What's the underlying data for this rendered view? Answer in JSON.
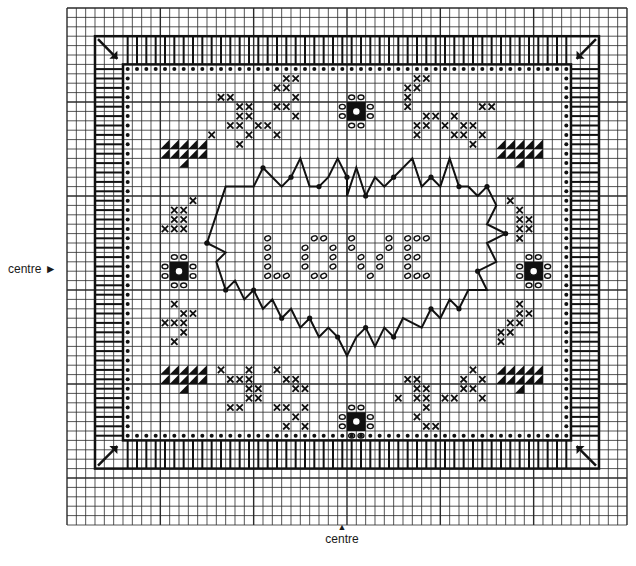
{
  "labels": {
    "centre_left": "centre ►",
    "centre_bottom_arrow": "▲",
    "centre_bottom": "centre"
  },
  "grid": {
    "left": 67,
    "top": 8,
    "cols": 60,
    "rows": 55,
    "cell_w": 9.333,
    "cell_h": 9.4,
    "line_color": "#2a2a2a",
    "bold_every": 10
  },
  "pattern": {
    "title": "LOVE heart sampler cross-stitch chart",
    "centre_text": "LOVE",
    "colors": {
      "ink": "#111111",
      "paper": "#ffffff"
    },
    "border": {
      "outer": [
        3,
        3,
        57,
        49
      ],
      "inner": [
        6,
        6,
        54,
        46
      ]
    },
    "dot_frame": [
      6,
      6,
      54,
      46
    ],
    "heart_outline": [
      [
        15,
        25
      ],
      [
        17,
        19
      ],
      [
        20,
        19
      ],
      [
        21,
        17
      ],
      [
        22,
        18
      ],
      [
        23,
        19
      ],
      [
        24,
        18
      ],
      [
        25,
        16
      ],
      [
        26,
        19
      ],
      [
        27,
        19
      ],
      [
        28,
        18
      ],
      [
        29,
        16
      ],
      [
        30,
        18
      ],
      [
        30,
        20
      ],
      [
        31,
        17
      ],
      [
        32,
        20
      ],
      [
        33,
        18
      ],
      [
        34,
        19
      ],
      [
        35,
        18
      ],
      [
        37,
        16
      ],
      [
        38,
        19
      ],
      [
        39,
        18
      ],
      [
        40,
        19
      ],
      [
        41,
        16
      ],
      [
        42,
        19
      ],
      [
        43,
        19
      ],
      [
        44,
        20
      ],
      [
        45,
        19
      ],
      [
        46,
        21
      ],
      [
        45,
        23
      ],
      [
        47,
        24
      ],
      [
        45,
        25
      ],
      [
        46,
        27
      ],
      [
        44,
        28
      ],
      [
        45,
        30
      ],
      [
        43,
        30
      ],
      [
        42,
        32
      ],
      [
        41,
        31
      ],
      [
        40,
        33
      ],
      [
        39,
        32
      ],
      [
        38,
        34
      ],
      [
        36,
        33
      ],
      [
        35,
        35
      ],
      [
        34,
        34
      ],
      [
        33,
        36
      ],
      [
        32,
        34
      ],
      [
        31,
        35
      ],
      [
        30,
        37
      ],
      [
        29,
        35
      ],
      [
        28,
        34
      ],
      [
        27,
        35
      ],
      [
        26,
        33
      ],
      [
        25,
        34
      ],
      [
        24,
        32
      ],
      [
        23,
        33
      ],
      [
        22,
        31
      ],
      [
        21,
        32
      ],
      [
        20,
        30
      ],
      [
        19,
        31
      ],
      [
        18,
        29
      ],
      [
        17,
        30
      ],
      [
        16,
        27
      ],
      [
        17,
        26
      ],
      [
        15,
        25
      ]
    ],
    "love_letters": [
      {
        "letter": "L",
        "cells": [
          [
            21,
            24
          ],
          [
            21,
            25
          ],
          [
            21,
            26
          ],
          [
            21,
            27
          ],
          [
            21,
            28
          ],
          [
            22,
            28
          ],
          [
            23,
            28
          ]
        ]
      },
      {
        "letter": "O",
        "cells": [
          [
            26,
            24
          ],
          [
            27,
            24
          ],
          [
            25,
            25
          ],
          [
            28,
            25
          ],
          [
            25,
            26
          ],
          [
            28,
            26
          ],
          [
            25,
            27
          ],
          [
            28,
            27
          ],
          [
            26,
            28
          ],
          [
            27,
            28
          ]
        ]
      },
      {
        "letter": "V",
        "cells": [
          [
            30,
            24
          ],
          [
            30,
            25
          ],
          [
            31,
            26
          ],
          [
            33,
            26
          ],
          [
            31,
            27
          ],
          [
            33,
            27
          ],
          [
            32,
            28
          ],
          [
            34,
            24
          ],
          [
            34,
            25
          ]
        ]
      },
      {
        "letter": "E",
        "cells": [
          [
            36,
            24
          ],
          [
            37,
            24
          ],
          [
            38,
            24
          ],
          [
            36,
            25
          ],
          [
            36,
            26
          ],
          [
            37,
            26
          ],
          [
            36,
            27
          ],
          [
            36,
            28
          ],
          [
            37,
            28
          ],
          [
            38,
            28
          ]
        ]
      }
    ],
    "motifs": {
      "triangles": [
        [
          10,
          14
        ],
        [
          46,
          14
        ],
        [
          10,
          38
        ],
        [
          46,
          38
        ]
      ],
      "rosettes": [
        [
          11,
          27
        ],
        [
          30,
          10
        ],
        [
          49,
          27
        ],
        [
          30,
          43
        ]
      ],
      "cross_clusters": [
        [
          [
            16,
            9
          ],
          [
            17,
            9
          ],
          [
            18,
            10
          ],
          [
            19,
            10
          ],
          [
            18,
            11
          ],
          [
            19,
            11
          ],
          [
            17,
            12
          ],
          [
            18,
            12
          ],
          [
            19,
            13
          ],
          [
            20,
            12
          ],
          [
            22,
            10
          ],
          [
            23,
            10
          ],
          [
            24,
            9
          ],
          [
            22,
            8
          ],
          [
            23,
            8
          ],
          [
            23,
            7
          ],
          [
            24,
            7
          ],
          [
            24,
            11
          ],
          [
            15,
            13
          ],
          [
            18,
            14
          ],
          [
            21,
            12
          ],
          [
            22,
            13
          ]
        ],
        [
          [
            36,
            8
          ],
          [
            37,
            8
          ],
          [
            36,
            9
          ],
          [
            36,
            10
          ],
          [
            37,
            7
          ],
          [
            38,
            7
          ],
          [
            38,
            11
          ],
          [
            39,
            11
          ],
          [
            37,
            12
          ],
          [
            38,
            12
          ],
          [
            37,
            13
          ],
          [
            41,
            11
          ],
          [
            42,
            12
          ],
          [
            42,
            13
          ],
          [
            43,
            12
          ],
          [
            44,
            13
          ],
          [
            43,
            14
          ],
          [
            44,
            10
          ],
          [
            45,
            10
          ],
          [
            40,
            12
          ],
          [
            41,
            13
          ]
        ],
        [
          [
            16,
            38
          ],
          [
            17,
            39
          ],
          [
            18,
            39
          ],
          [
            19,
            38
          ],
          [
            19,
            39
          ],
          [
            19,
            40
          ],
          [
            20,
            40
          ],
          [
            19,
            41
          ],
          [
            20,
            41
          ],
          [
            17,
            42
          ],
          [
            18,
            42
          ],
          [
            23,
            39
          ],
          [
            24,
            39
          ],
          [
            24,
            40
          ],
          [
            25,
            40
          ],
          [
            22,
            42
          ],
          [
            23,
            42
          ],
          [
            25,
            42
          ],
          [
            24,
            43
          ],
          [
            25,
            44
          ],
          [
            23,
            44
          ],
          [
            22,
            38
          ]
        ],
        [
          [
            36,
            39
          ],
          [
            37,
            39
          ],
          [
            37,
            40
          ],
          [
            38,
            40
          ],
          [
            37,
            41
          ],
          [
            38,
            41
          ],
          [
            38,
            42
          ],
          [
            37,
            43
          ],
          [
            38,
            44
          ],
          [
            39,
            44
          ],
          [
            40,
            41
          ],
          [
            41,
            41
          ],
          [
            42,
            40
          ],
          [
            43,
            40
          ],
          [
            42,
            39
          ],
          [
            43,
            38
          ],
          [
            44,
            39
          ],
          [
            44,
            41
          ],
          [
            35,
            41
          ]
        ],
        [
          [
            11,
            21
          ],
          [
            12,
            21
          ],
          [
            12,
            22
          ],
          [
            11,
            22
          ],
          [
            12,
            23
          ],
          [
            13,
            20
          ],
          [
            11,
            23
          ],
          [
            10,
            23
          ]
        ],
        [
          [
            11,
            31
          ],
          [
            12,
            32
          ],
          [
            11,
            33
          ],
          [
            12,
            33
          ],
          [
            10,
            33
          ],
          [
            12,
            34
          ],
          [
            11,
            35
          ],
          [
            13,
            32
          ]
        ],
        [
          [
            47,
            20
          ],
          [
            48,
            21
          ],
          [
            48,
            22
          ],
          [
            49,
            22
          ],
          [
            48,
            23
          ],
          [
            49,
            23
          ],
          [
            48,
            24
          ]
        ],
        [
          [
            48,
            31
          ],
          [
            48,
            32
          ],
          [
            47,
            33
          ],
          [
            48,
            33
          ],
          [
            49,
            32
          ],
          [
            46,
            34
          ],
          [
            47,
            34
          ],
          [
            46,
            35
          ]
        ]
      ]
    }
  }
}
